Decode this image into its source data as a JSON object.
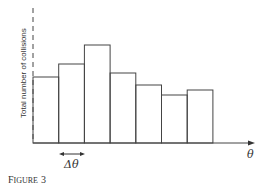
{
  "figure": {
    "caption_prefix": "F",
    "caption_smallcaps": "IGURE",
    "caption_number": "3"
  },
  "chart_data": {
    "type": "bar",
    "title": "",
    "xlabel": "θ",
    "ylabel": "Total number of collisions",
    "annotation": "Δθ",
    "categories": [
      "bin1",
      "bin2",
      "bin3",
      "bin4",
      "bin5",
      "bin6",
      "bin7"
    ],
    "values": [
      66,
      79,
      98,
      70,
      58,
      48,
      53
    ],
    "ylim": [
      0,
      135
    ],
    "grid": false,
    "legend": "none"
  },
  "geometry": {
    "x0": 33,
    "baseline": 143,
    "bin_width": 25.7
  }
}
